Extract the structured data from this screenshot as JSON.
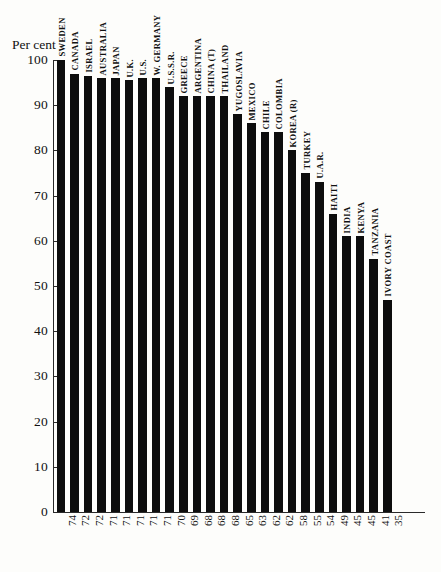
{
  "chart": {
    "axis_title": "Per cent",
    "y_ticks": [
      0,
      10,
      20,
      30,
      40,
      50,
      60,
      70,
      80,
      90,
      100
    ],
    "bar_color": "#0d0d0d",
    "axis_color": "#2a2a2a"
  },
  "chart_data": {
    "type": "bar",
    "title": "",
    "subtitle": "",
    "xlabel": "",
    "ylabel": "Per cent",
    "ylim": [
      0,
      100
    ],
    "grid": false,
    "legend": "none",
    "categories": [
      "SWEDEN",
      "CANADA",
      "ISRAEL",
      "AUSTRALIA",
      "JAPAN",
      "U.K.",
      "U.S.",
      "W. GERMANY",
      "U.S.S.R.",
      "GREECE",
      "ARGENTINA",
      "CHINA (T)",
      "THAILAND",
      "YUGOSLAVIA",
      "MEXICO",
      "CHILE",
      "COLOMBIA",
      "KOREA (R)",
      "TURKEY",
      "U.A.R.",
      "HAITI",
      "INDIA",
      "KENYA",
      "TANZANIA",
      "IVORY COAST"
    ],
    "values": [
      100,
      97,
      96.5,
      96,
      96,
      95.5,
      96,
      96,
      94,
      92,
      92,
      92,
      92,
      88,
      86,
      84,
      84,
      80,
      75,
      73,
      66,
      61,
      61,
      56,
      47
    ],
    "x_tick_labels": [
      "74",
      "72",
      "72",
      "71",
      "71",
      "71",
      "71",
      "71",
      "70",
      "69",
      "68",
      "68",
      "68",
      "65",
      "63",
      "62",
      "62",
      "58",
      "55",
      "54",
      "49",
      "45",
      "45",
      "41",
      "35"
    ]
  }
}
